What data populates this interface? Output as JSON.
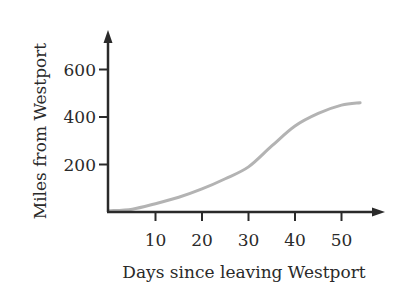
{
  "chart_data": {
    "type": "line",
    "title": "",
    "xlabel": "Days since leaving Westport",
    "ylabel": "Miles from Westport",
    "x_ticks": [
      10,
      20,
      30,
      40,
      50
    ],
    "y_ticks": [
      200,
      400,
      600
    ],
    "xlim": [
      0,
      59
    ],
    "ylim": [
      0,
      770
    ],
    "grid": false,
    "legend": null,
    "series": [
      {
        "name": "Distance",
        "color": "#b3b3b3",
        "x": [
          0,
          5,
          10,
          15,
          20,
          25,
          30,
          35,
          40,
          45,
          50,
          54
        ],
        "values": [
          5,
          12,
          35,
          62,
          97,
          140,
          190,
          278,
          362,
          415,
          450,
          460
        ]
      }
    ]
  },
  "axes": {
    "color": "#2a2a2a"
  }
}
